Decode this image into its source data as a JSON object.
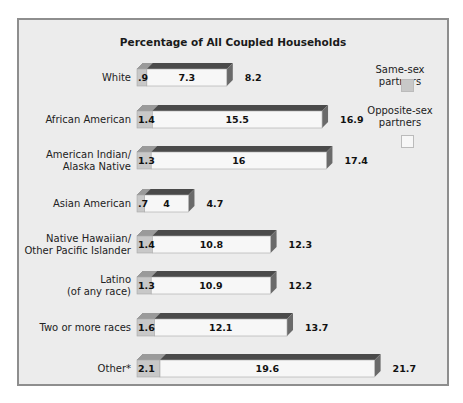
{
  "chart_data": {
    "type": "bar",
    "stacked": true,
    "orientation": "horizontal",
    "title": "Percentage of All Coupled Households",
    "xlabel": "",
    "ylabel": "",
    "grid": false,
    "legend_position": "right",
    "categories": [
      "White",
      "African American",
      "American Indian/\nAlaska Native",
      "Asian American",
      "Native Hawaiian/\nOther Pacific Islander",
      "Latino\n(of any race)",
      "Two or more races",
      "Other*"
    ],
    "series": [
      {
        "name": "Same-sex partners",
        "color": "#c8c8c8",
        "values": [
          0.9,
          1.4,
          1.3,
          0.7,
          1.4,
          1.3,
          1.6,
          2.1
        ],
        "labels": [
          ".9",
          "1.4",
          "1.3",
          ".7",
          "1.4",
          "1.3",
          "1.6",
          "2.1"
        ]
      },
      {
        "name": "Opposite-sex partners",
        "color": "#f7f7f7",
        "values": [
          7.3,
          15.5,
          16,
          4,
          10.8,
          10.9,
          12.1,
          19.6
        ],
        "labels": [
          "7.3",
          "15.5",
          "16",
          "4",
          "10.8",
          "10.9",
          "12.1",
          "19.6"
        ]
      }
    ],
    "totals": [
      8.2,
      16.9,
      17.4,
      4.7,
      12.3,
      12.2,
      13.7,
      21.7
    ],
    "total_labels": [
      "8.2",
      "16.9",
      "17.4",
      "4.7",
      "12.3",
      "12.2",
      "13.7",
      "21.7"
    ],
    "xlim": [
      0,
      22
    ]
  },
  "legend": {
    "same_sex": "Same-sex partners",
    "opposite_sex_line1": "Opposite-sex",
    "opposite_sex_line2": "partners"
  },
  "colors": {
    "same_sex": "#c8c8c8",
    "opposite_sex": "#f7f7f7",
    "top_face": "#4a4a4a",
    "side_face": "#6a6a6a",
    "background": "#ececec"
  }
}
